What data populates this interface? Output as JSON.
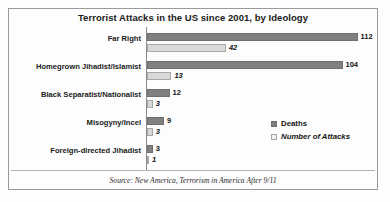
{
  "chart_data": {
    "type": "bar",
    "orientation": "horizontal",
    "title": "Terrorist Attacks in the US since 2001, by Ideology",
    "xlabel": "",
    "ylabel": "",
    "grid": false,
    "legend_position": "bottom-right",
    "xlim": [
      0,
      120
    ],
    "categories": [
      "Far Right",
      "Homegrown Jihadist/Islamist",
      "Black Separatist/Nationalist",
      "Misogyny/Incel",
      "Foreign-directed Jihadist"
    ],
    "series": [
      {
        "name": "Deaths",
        "color": "#808080",
        "values": [
          112,
          104,
          12,
          9,
          3
        ]
      },
      {
        "name": "Number of Attacks",
        "color": "#d9d9d9",
        "values": [
          42,
          13,
          3,
          3,
          1
        ]
      }
    ],
    "source": "Source: New America, Terrorism in America After 9/11"
  },
  "legend": {
    "items": [
      {
        "label": "Deaths",
        "swatch": "deaths"
      },
      {
        "label": "Number of Attacks",
        "swatch": "attacks"
      }
    ]
  }
}
